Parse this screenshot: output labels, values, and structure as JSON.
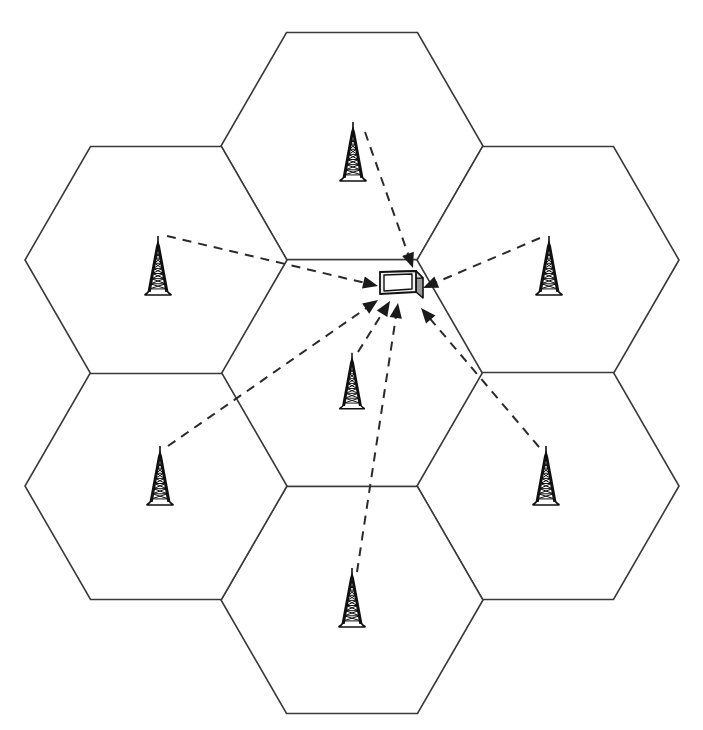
{
  "figure": {
    "background_color": "#ffffff",
    "cell_stroke_color": "#3a3a3a",
    "link_stroke_color": "#2b2b2b",
    "tower_color": "#101010",
    "canvas": {
      "width": 703,
      "height": 730
    }
  },
  "layout": {
    "center": {
      "x": 352,
      "y": 373
    },
    "hex_circumradius": 131,
    "hex_orientation": "flat-top-vertex-right",
    "neighbor_spacing": 227
  },
  "cells": [
    {
      "id": "cell-center",
      "label": "Center cell",
      "cx": 352,
      "cy": 373
    },
    {
      "id": "cell-north",
      "label": "North cell",
      "cx": 352,
      "cy": 146
    },
    {
      "id": "cell-northeast",
      "label": "North-east cell",
      "cx": 548,
      "cy": 260
    },
    {
      "id": "cell-southeast",
      "label": "South-east cell",
      "cx": 548,
      "cy": 486
    },
    {
      "id": "cell-south",
      "label": "South cell",
      "cx": 352,
      "cy": 600
    },
    {
      "id": "cell-southwest",
      "label": "South-west cell",
      "cx": 156,
      "cy": 486
    },
    {
      "id": "cell-northwest",
      "label": "North-west cell",
      "cx": 156,
      "cy": 260
    }
  ],
  "towers": [
    {
      "id": "tower-north",
      "label": "Base station north",
      "x": 353,
      "y": 158,
      "scale": 1.0,
      "link_from": {
        "x": 365,
        "y": 132
      }
    },
    {
      "id": "tower-northwest",
      "label": "Base station north-west",
      "x": 158,
      "y": 272,
      "scale": 1.0,
      "link_from": {
        "x": 167,
        "y": 236
      }
    },
    {
      "id": "tower-northeast",
      "label": "Base station north-east",
      "x": 549,
      "y": 272,
      "scale": 1.0,
      "link_from": {
        "x": 540,
        "y": 238
      }
    },
    {
      "id": "tower-center",
      "label": "Base station center",
      "x": 352,
      "y": 387,
      "scale": 0.95,
      "link_from": {
        "x": 358,
        "y": 352
      }
    },
    {
      "id": "tower-southwest",
      "label": "Base station south-west",
      "x": 160,
      "y": 482,
      "scale": 1.0,
      "link_from": {
        "x": 168,
        "y": 446
      }
    },
    {
      "id": "tower-southeast",
      "label": "Base station south-east",
      "x": 546,
      "y": 482,
      "scale": 1.0,
      "link_from": {
        "x": 539,
        "y": 447
      }
    },
    {
      "id": "tower-south",
      "label": "Base station south",
      "x": 352,
      "y": 604,
      "scale": 1.0,
      "link_from": {
        "x": 357,
        "y": 572
      }
    }
  ],
  "device": {
    "id": "mobile-device",
    "label": "Mobile device",
    "x": 399,
    "y": 284,
    "type": "handset"
  },
  "signal_links": [
    {
      "id": "link-north-to-device",
      "label": "North cell signal",
      "from_tower": "tower-north",
      "x1": 365,
      "y1": 132,
      "x2": 413,
      "y2": 268,
      "arrow_angle_deg": 70
    },
    {
      "id": "link-northwest-to-device",
      "label": "North-west cell signal",
      "from_tower": "tower-northwest",
      "x1": 167,
      "y1": 236,
      "x2": 378,
      "y2": 286,
      "arrow_angle_deg": 13
    },
    {
      "id": "link-northeast-to-device",
      "label": "North-east cell signal",
      "from_tower": "tower-northeast",
      "x1": 540,
      "y1": 238,
      "x2": 423,
      "y2": 288,
      "arrow_angle_deg": 203
    },
    {
      "id": "link-southwest-to-device",
      "label": "South-west cell signal",
      "from_tower": "tower-southwest",
      "x1": 168,
      "y1": 446,
      "x2": 378,
      "y2": 300,
      "arrow_angle_deg": -35
    },
    {
      "id": "link-center-to-device",
      "label": "Center cell signal",
      "from_tower": "tower-center",
      "x1": 358,
      "y1": 352,
      "x2": 390,
      "y2": 301,
      "arrow_angle_deg": -58
    },
    {
      "id": "link-south-to-device",
      "label": "South cell signal",
      "from_tower": "tower-south",
      "x1": 357,
      "y1": 572,
      "x2": 398,
      "y2": 303,
      "arrow_angle_deg": -81
    },
    {
      "id": "link-southeast-to-device",
      "label": "South-east cell signal",
      "from_tower": "tower-southeast",
      "x1": 539,
      "y1": 447,
      "x2": 421,
      "y2": 308,
      "arrow_angle_deg": -130
    }
  ]
}
